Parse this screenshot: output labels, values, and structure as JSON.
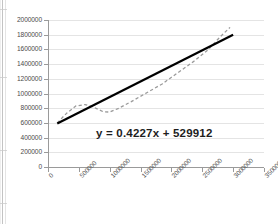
{
  "chart_data": {
    "type": "line",
    "title": "",
    "xlabel": "",
    "ylabel": "",
    "xlim": [
      0,
      3500000
    ],
    "ylim": [
      0,
      2000000
    ],
    "grid": true,
    "grid_axis": "y",
    "legend": "none",
    "y_ticks": [
      "2000000",
      "1800000",
      "1600000",
      "1400000",
      "1200000",
      "1000000",
      "800000",
      "600000",
      "400000",
      "200000",
      "0"
    ],
    "y_tick_values": [
      2000000,
      1800000,
      1600000,
      1400000,
      1200000,
      1000000,
      800000,
      600000,
      400000,
      200000,
      0
    ],
    "x_ticks": [
      "0",
      "500000",
      "1000000",
      "1500000",
      "2000000",
      "2500000",
      "3000000",
      "3500000"
    ],
    "x_tick_values": [
      0,
      500000,
      1000000,
      1500000,
      2000000,
      2500000,
      3000000,
      3500000
    ],
    "annotations": [
      {
        "name": "trendline-equation",
        "text": "y = 0.4227x + 529912",
        "slope": 0.4227,
        "intercept": 529912
      }
    ],
    "series": [
      {
        "name": "data-series",
        "style": "dashed",
        "color": "#9a9a9a",
        "x": [
          150000,
          300000,
          450000,
          600000,
          750000,
          900000,
          1000000,
          1150000,
          1350000,
          1600000,
          1850000,
          2100000,
          2350000,
          2600000,
          2800000,
          2950000
        ],
        "y": [
          600000,
          730000,
          830000,
          850000,
          810000,
          750000,
          748000,
          800000,
          890000,
          1010000,
          1130000,
          1280000,
          1430000,
          1600000,
          1780000,
          1900000
        ]
      },
      {
        "name": "linear-trendline",
        "style": "solid",
        "color": "#000000",
        "x": [
          150000,
          3000000
        ],
        "y": [
          593000,
          1798000
        ]
      }
    ]
  },
  "page": {
    "background": "#ffffff",
    "accent": "#000000",
    "series_color": "#9a9a9a",
    "grid_color": "#e4e4e4",
    "axis_color": "#9a9a9a",
    "text_color": "#4a4a4a"
  }
}
